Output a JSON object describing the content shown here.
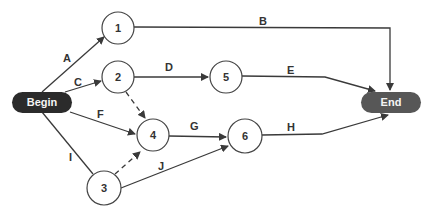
{
  "diagram": {
    "type": "activity-network",
    "colors": {
      "begin_fill": "#2b2b2b",
      "end_fill": "#575757",
      "line": "#3a3a3a",
      "node_stroke": "#444444",
      "node_fill": "#ffffff"
    },
    "terminals": {
      "begin": {
        "label": "Begin",
        "x": 12,
        "y": 92,
        "w": 60,
        "h": 21
      },
      "end": {
        "label": "End",
        "x": 361,
        "y": 92,
        "w": 60,
        "h": 21
      }
    },
    "nodes": [
      {
        "id": "1",
        "label": "1",
        "cx": 118,
        "cy": 28,
        "r": 16
      },
      {
        "id": "2",
        "label": "2",
        "cx": 118,
        "cy": 77,
        "r": 16
      },
      {
        "id": "3",
        "label": "3",
        "cx": 104,
        "cy": 188,
        "r": 17
      },
      {
        "id": "4",
        "label": "4",
        "cx": 153,
        "cy": 135,
        "r": 16
      },
      {
        "id": "5",
        "label": "5",
        "cx": 226,
        "cy": 77,
        "r": 16
      },
      {
        "id": "6",
        "label": "6",
        "cx": 245,
        "cy": 136,
        "r": 17
      }
    ],
    "activities": [
      {
        "label": "A",
        "from": "Begin",
        "to": "1",
        "dashed": false
      },
      {
        "label": "B",
        "from": "1",
        "to": "End",
        "dashed": false
      },
      {
        "label": "C",
        "from": "Begin",
        "to": "2",
        "dashed": false
      },
      {
        "label": "D",
        "from": "2",
        "to": "5",
        "dashed": false
      },
      {
        "label": "E",
        "from": "5",
        "to": "End",
        "dashed": false
      },
      {
        "label": "F",
        "from": "Begin",
        "to": "4",
        "dashed": false
      },
      {
        "label": "G",
        "from": "4",
        "to": "6",
        "dashed": false
      },
      {
        "label": "H",
        "from": "6",
        "to": "End",
        "dashed": false
      },
      {
        "label": "I",
        "from": "Begin",
        "to": "3",
        "dashed": false
      },
      {
        "label": "J",
        "from": "3",
        "to": "6",
        "dashed": false
      },
      {
        "label": "",
        "from": "2",
        "to": "4",
        "dashed": true
      },
      {
        "label": "",
        "from": "3",
        "to": "4",
        "dashed": true
      }
    ]
  }
}
